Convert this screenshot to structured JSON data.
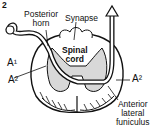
{
  "figure": {
    "number": "2",
    "labels": {
      "posterior_horn": [
        "Posterior",
        "horn"
      ],
      "synapse": "Synapse",
      "spinal_cord": [
        "Spinal",
        "cord"
      ],
      "a1": "A¹",
      "a2_left": "A²",
      "a2_right": "A²",
      "anterior_lateral_funiculus": [
        "Anterior",
        "lateral",
        "funiculus"
      ]
    }
  }
}
